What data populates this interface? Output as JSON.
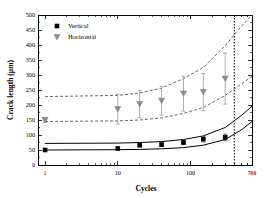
{
  "chart_data": {
    "type": "scatter",
    "title": "",
    "xlabel": "Cycles",
    "ylabel": "Crack length (μm)",
    "xscale": "log",
    "yscale": "linear",
    "xlim": [
      0.8,
      700
    ],
    "ylim": [
      0,
      500
    ],
    "grid": false,
    "legend_position": "top-left",
    "xticks": [
      1,
      10,
      100
    ],
    "xtick_labels": [
      "1",
      "10",
      "100"
    ],
    "x_end_label": "700",
    "x_end_label_color": "#b02020",
    "yticks": [
      0,
      50,
      100,
      150,
      200,
      250,
      300,
      350,
      400,
      450,
      500
    ],
    "ytick_labels": [
      "0",
      "50",
      "100",
      "150",
      "200",
      "250",
      "300",
      "350",
      "400",
      "450",
      "500"
    ],
    "annotations": [
      {
        "name": "end-of-test-line",
        "type": "vline",
        "x": 400,
        "style": "dotted"
      }
    ],
    "series": [
      {
        "name": "Vertical",
        "marker": "square",
        "marker_color": "#000000",
        "x": [
          1,
          10,
          20,
          40,
          80,
          150,
          300
        ],
        "y": [
          50,
          55,
          66,
          68,
          75,
          86,
          92
        ],
        "yerr": [
          3,
          4,
          5,
          5,
          7,
          9,
          11
        ]
      },
      {
        "name": "Horizontal",
        "marker": "triangle-down",
        "marker_color": "#8d8d8d",
        "x": [
          1,
          10,
          20,
          40,
          80,
          150,
          300
        ],
        "y": [
          150,
          186,
          203,
          214,
          238,
          243,
          288
        ],
        "yerr": [
          8,
          50,
          45,
          48,
          58,
          62,
          85
        ]
      }
    ],
    "fit_bands": [
      {
        "name": "vertical-upper-fit",
        "style": "solid",
        "color": "#000000",
        "x": [
          1,
          10,
          20,
          40,
          80,
          150,
          300,
          500,
          700
        ],
        "y": [
          72,
          73,
          75,
          78,
          85,
          97,
          125,
          165,
          196
        ]
      },
      {
        "name": "vertical-lower-fit",
        "style": "solid",
        "color": "#000000",
        "x": [
          1,
          10,
          20,
          40,
          80,
          150,
          300,
          500,
          700
        ],
        "y": [
          50,
          51,
          52,
          54,
          58,
          66,
          85,
          117,
          145
        ]
      },
      {
        "name": "horizontal-upper-band",
        "style": "dashed",
        "color": "#555555",
        "x": [
          1,
          10,
          20,
          40,
          80,
          150,
          300,
          500,
          700
        ],
        "y": [
          228,
          232,
          240,
          256,
          288,
          325,
          398,
          462,
          500
        ]
      },
      {
        "name": "horizontal-lower-band",
        "style": "dashed",
        "color": "#555555",
        "x": [
          1,
          10,
          20,
          40,
          80,
          150,
          300,
          500,
          700
        ],
        "y": [
          145,
          147,
          150,
          157,
          172,
          192,
          232,
          270,
          295
        ]
      }
    ]
  },
  "legend": {
    "items": [
      {
        "label": "Vertical",
        "marker": "square"
      },
      {
        "label": "Horizontal",
        "marker": "triangle-down"
      }
    ]
  }
}
